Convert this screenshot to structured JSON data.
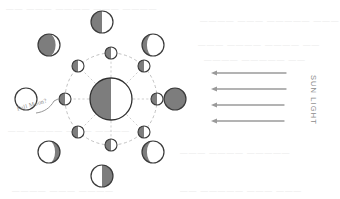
{
  "diagram": {
    "sun_light_label": "SUN LIGHT",
    "full_moon_label": "Full Moon?",
    "colors": {
      "shadow_gray": "#7d7d7d",
      "lit_white": "#ffffff",
      "outline": "#3a3a3a",
      "orbit_line": "#b9b9b9",
      "ray_line": "#c9c9c9",
      "arrow": "#9a9a9a",
      "ghost_text": "#cfcfcf",
      "background": "#ffffff"
    },
    "earth": {
      "name": "earth",
      "cx": 111,
      "cy": 99,
      "r": 21,
      "lit_side": "right",
      "shadow_side": "left"
    },
    "orbit": {
      "cx": 111,
      "cy": 99,
      "r": 46,
      "style": "dashed"
    },
    "inner_moons": [
      {
        "name": "inner-moon-top",
        "cx": 111,
        "cy": 53,
        "r": 6,
        "shadow_side": "left"
      },
      {
        "name": "inner-moon-top-right",
        "cx": 144,
        "cy": 66,
        "r": 6,
        "shadow_side": "left"
      },
      {
        "name": "inner-moon-right",
        "cx": 157,
        "cy": 99,
        "r": 6,
        "shadow_side": "left"
      },
      {
        "name": "inner-moon-bottom-right",
        "cx": 144,
        "cy": 132,
        "r": 6,
        "shadow_side": "left"
      },
      {
        "name": "inner-moon-bottom",
        "cx": 111,
        "cy": 145,
        "r": 6,
        "shadow_side": "left"
      },
      {
        "name": "inner-moon-bottom-left",
        "cx": 78,
        "cy": 132,
        "r": 6,
        "shadow_side": "left"
      },
      {
        "name": "inner-moon-left",
        "cx": 65,
        "cy": 99,
        "r": 6,
        "shadow_side": "left"
      },
      {
        "name": "inner-moon-top-left",
        "cx": 78,
        "cy": 66,
        "r": 6,
        "shadow_side": "left"
      }
    ],
    "outer_moons": [
      {
        "name": "outer-moon-top",
        "phase": "first-quarter",
        "cx": 102,
        "cy": 22,
        "r": 11,
        "shadow_side": "left",
        "terminator": 0.0
      },
      {
        "name": "outer-moon-top-right",
        "phase": "waxing-crescent",
        "cx": 153,
        "cy": 45,
        "r": 11,
        "shadow_side": "left",
        "terminator": 0.55
      },
      {
        "name": "outer-moon-right",
        "phase": "new-moon",
        "cx": 175,
        "cy": 99,
        "r": 11,
        "shadow_side": "full",
        "terminator": 1.0
      },
      {
        "name": "outer-moon-bottom-right",
        "phase": "waning-crescent",
        "cx": 153,
        "cy": 152,
        "r": 11,
        "shadow_side": "left",
        "terminator": 0.55
      },
      {
        "name": "outer-moon-bottom",
        "phase": "last-quarter",
        "cx": 102,
        "cy": 176,
        "r": 11,
        "shadow_side": "right",
        "terminator": 0.0
      },
      {
        "name": "outer-moon-bottom-left",
        "phase": "waning-gibbous",
        "cx": 49,
        "cy": 152,
        "r": 11,
        "shadow_side": "right",
        "terminator": 0.55
      },
      {
        "name": "outer-moon-full",
        "phase": "full-moon",
        "cx": 26,
        "cy": 99,
        "r": 11,
        "shadow_side": "none",
        "terminator": 0.0
      },
      {
        "name": "outer-moon-top-left",
        "phase": "waxing-gibbous",
        "cx": 49,
        "cy": 45,
        "r": 11,
        "shadow_side": "left",
        "terminator": -0.6
      }
    ],
    "sun_rays": [
      {
        "name": "sun-ray-1",
        "y": 73,
        "x_tail": 286,
        "x_head": 211
      },
      {
        "name": "sun-ray-2",
        "y": 89,
        "x_tail": 286,
        "x_head": 211
      },
      {
        "name": "sun-ray-3",
        "y": 105,
        "x_tail": 284,
        "x_head": 211
      },
      {
        "name": "sun-ray-4",
        "y": 121,
        "x_tail": 284,
        "x_head": 211
      }
    ],
    "ghost_text_lines": [
      {
        "name": "ghost-line-1",
        "text": "—— ———  ———— ———  ————",
        "x": 6,
        "y": 4
      },
      {
        "name": "ghost-line-2",
        "text": "————  ——— —————  ———",
        "x": 200,
        "y": 16
      },
      {
        "name": "ghost-line-3",
        "text": "——— ————  ———— ——",
        "x": 198,
        "y": 40
      },
      {
        "name": "ghost-line-4",
        "text": "————  ————— ——",
        "x": 204,
        "y": 55
      },
      {
        "name": "ghost-line-5",
        "text": "—— ————  ——— ————",
        "x": 8,
        "y": 126
      },
      {
        "name": "ghost-line-6",
        "text": "——— ———— —————",
        "x": 180,
        "y": 148
      },
      {
        "name": "ghost-line-7",
        "text": "———— ——— ————",
        "x": 12,
        "y": 186
      },
      {
        "name": "ghost-line-8",
        "text": "—— ————— ——— ———",
        "x": 180,
        "y": 186
      }
    ]
  }
}
